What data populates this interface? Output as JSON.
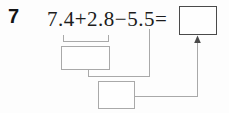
{
  "colors": {
    "background": "#fdfdfd",
    "text": "#1c1c1c",
    "guide_line": "#a9a9a9",
    "answer_box_border": "#4a4a4a"
  },
  "problem": {
    "number": "7",
    "expression": "7.4+2.8−5.5="
  },
  "work_boxes": {
    "step1_value": "",
    "step2_value": "",
    "answer_value": ""
  },
  "icons": {
    "arrow_up": "arrowhead-up-icon"
  }
}
